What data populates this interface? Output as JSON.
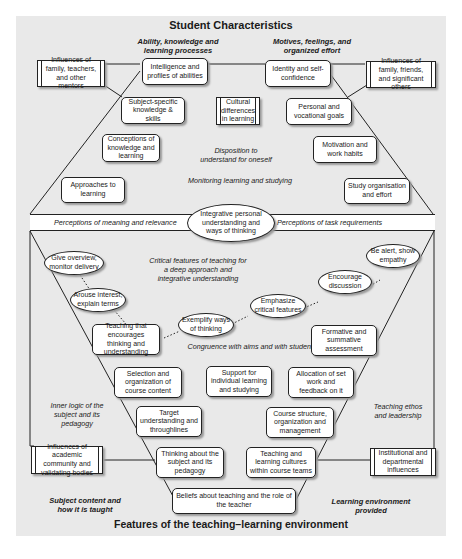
{
  "title_top": "Student Characteristics",
  "title_bottom": "Features of the teaching–learning environment",
  "headings": {
    "ability": "Ability, knowledge and learning processes",
    "motives": "Motives, feelings, and organized effort",
    "subject_content": "Subject content and how it is taught",
    "learning_env": "Learning environment provided"
  },
  "italic_labels": {
    "disposition": "Disposition to understand for oneself",
    "monitoring": "Monitoring learning and studying",
    "meaning": "Perceptions of meaning and relevance",
    "task": "Perceptions of task requirements",
    "critical": "Critical features of teaching for a deep approach and integrative understanding",
    "congruence": "Congruence with aims and with students",
    "inner_logic": "Inner logic of the subject and its pedagogy",
    "ethos": "Teaching ethos and leadership"
  },
  "student_boxes": {
    "intelligence": "Intelligence and profiles of abilities",
    "identity": "Identity and self-confidence",
    "subject_specific": "Subject-specific knowledge & skills",
    "cultural": "Cultural differences in learning",
    "personal_goals": "Personal and vocational goals",
    "conceptions": "Conceptions of knowledge and learning",
    "motivation": "Motivation and work habits",
    "approaches": "Approaches to learning",
    "study_org": "Study organisation and effort"
  },
  "influences": {
    "family_teachers": "Influences of family, teachers, and other mentors",
    "family_friends": "Influences of family, friends, and significant others",
    "academic": "Influences of academic community and validating bodies",
    "institutional": "Institutional and departmental influences"
  },
  "central_oval": "Integrative personal understanding and ways of thinking",
  "teaching_ovals": {
    "overview": "Give overview, monitor delivery",
    "arouse": "Arouse interest, explain terms",
    "exemplify": "Exemplify ways of thinking",
    "emphasize": "Emphasize critical features",
    "encourage": "Encourage discussion",
    "alert": "Be alert, show empathy"
  },
  "teaching_boxes": {
    "encourages_thinking": "Teaching that encourages thinking and understanding",
    "formative": "Formative and summative assessment",
    "selection": "Selection and organization of course content",
    "support": "Support for individual learning and studying",
    "allocation": "Allocation of set work and feedback on it",
    "target": "Target understanding and throughlines",
    "course_structure": "Course structure, organization and management",
    "thinking_about": "Thinking about the subject and its pedagogy",
    "cultures": "Teaching and learning cultures within course teams",
    "beliefs": "Beliefs about teaching and the role of the teacher"
  }
}
